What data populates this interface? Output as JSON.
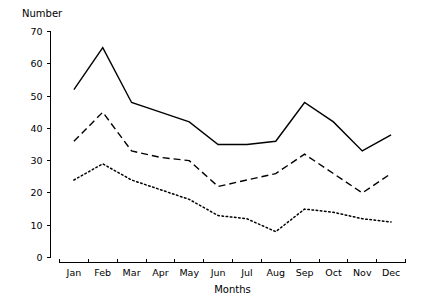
{
  "chart_data": {
    "type": "line",
    "title": "",
    "xlabel": "Months",
    "ylabel": "Number",
    "categories": [
      "Jan",
      "Feb",
      "Mar",
      "Apr",
      "May",
      "Jun",
      "Jul",
      "Aug",
      "Sep",
      "Oct",
      "Nov",
      "Dec"
    ],
    "ylim": [
      0,
      70
    ],
    "yticks": [
      0,
      10,
      20,
      30,
      40,
      50,
      60,
      70
    ],
    "grid": false,
    "legend": "none",
    "series": [
      {
        "name": "solid",
        "style": "solid",
        "color": "#000000",
        "values": [
          52,
          65,
          48,
          45,
          42,
          35,
          35,
          36,
          48,
          42,
          33,
          38
        ]
      },
      {
        "name": "dashed",
        "style": "dashed",
        "color": "#000000",
        "values": [
          36,
          45,
          33,
          31,
          30,
          22,
          24,
          26,
          32,
          26,
          20,
          26
        ]
      },
      {
        "name": "dotted",
        "style": "dotted",
        "color": "#000000",
        "values": [
          24,
          29,
          24,
          21,
          18,
          13,
          12,
          8,
          15,
          14,
          12,
          11
        ]
      }
    ]
  },
  "axes": {
    "y_title": "Number",
    "x_title": "Months",
    "y_tick_labels": [
      "0",
      "10",
      "20",
      "30",
      "40",
      "50",
      "60",
      "70"
    ],
    "x_tick_labels": [
      "Jan",
      "Feb",
      "Mar",
      "Apr",
      "May",
      "Jun",
      "Jul",
      "Aug",
      "Sep",
      "Oct",
      "Nov",
      "Dec"
    ]
  }
}
